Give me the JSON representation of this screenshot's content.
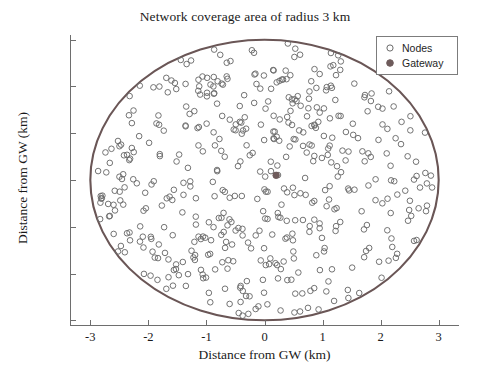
{
  "chart_data": {
    "type": "scatter",
    "title": "Network coverage area of radius 3 km",
    "xlabel": "Distance from GW (km)",
    "ylabel": "Distance from GW (km)",
    "xlim": [
      -3.35,
      3.35
    ],
    "ylim": [
      -3.1,
      3.1
    ],
    "xticks": [
      -3,
      -2,
      -1,
      0,
      1,
      2,
      3
    ],
    "xticklabels": [
      "-3",
      "-2",
      "-1",
      "0",
      "1",
      "2",
      "3"
    ],
    "yticks": [
      -3,
      -2,
      -1,
      0,
      1,
      2,
      3
    ],
    "yticklabels": [
      "-3",
      "-2",
      "-1",
      "0",
      "1",
      "2",
      "3"
    ],
    "grid": false,
    "legend_position": "upper right",
    "series": [
      {
        "name": "Nodes",
        "marker": "open-circle",
        "marker_size": 5.6,
        "color": "#6b6b6b",
        "fill": "none",
        "count": 500,
        "distribution": "uniform-in-disk",
        "radius_km": 3,
        "center": [
          0,
          0
        ],
        "seed": 20240617
      },
      {
        "name": "Gateway",
        "marker": "filled-circle",
        "marker_size": 6.4,
        "color": "#6e5b5b",
        "fill": "#6e5b5b",
        "points": [
          [
            0.2,
            0.1
          ]
        ]
      }
    ],
    "annotations": [
      {
        "type": "circle-boundary",
        "label": "coverage radius 3 km",
        "center": [
          0,
          0
        ],
        "radius": 3,
        "color": "#6a5656",
        "linewidth": 2.1
      }
    ]
  },
  "legend": {
    "entries": [
      {
        "label": "Nodes",
        "marker": "open-circle"
      },
      {
        "label": "Gateway",
        "marker": "filled-circle"
      }
    ]
  },
  "colors": {
    "axis": "#6e6e6e",
    "text": "#1a1a1a",
    "node_marker": "#6b6b6b",
    "gateway_marker": "#6e5b5b",
    "boundary": "#6a5656",
    "legend_border": "#7c7c7c",
    "background": "#ffffff"
  }
}
